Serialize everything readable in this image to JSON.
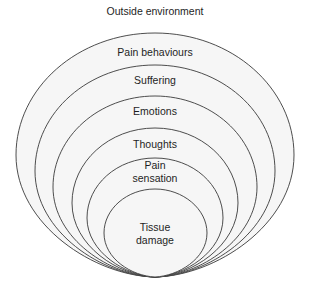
{
  "title": "Outside environment",
  "layers": [
    {
      "label": "Pain behaviours"
    },
    {
      "label": "Suffering"
    },
    {
      "label": "Emotions"
    },
    {
      "label": "Thoughts"
    },
    {
      "label_line1": "Pain",
      "label_line2": "sensation"
    },
    {
      "label_line1": "Tissue",
      "label_line2": "damage"
    }
  ],
  "colors": {
    "background": "#ffffff",
    "layer_fill": "#f6f6f6",
    "stroke": "#3a3a3a",
    "text": "#1e1e1e"
  }
}
